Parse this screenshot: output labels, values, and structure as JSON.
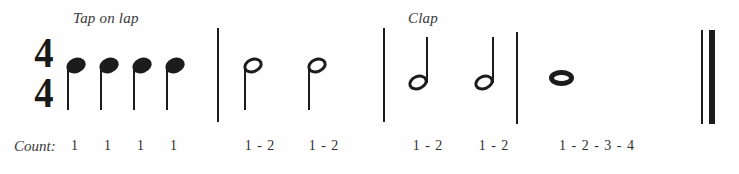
{
  "page": {
    "background_color": "#fefefe",
    "ink_color": "#1c1c1c"
  },
  "time_signature": {
    "numerator": "4",
    "denominator": "4",
    "label": "4/4"
  },
  "instructions": [
    {
      "text": "Tap on lap",
      "x": 73,
      "y": 10
    },
    {
      "text": "Clap",
      "x": 408,
      "y": 10
    }
  ],
  "count_row": {
    "label": "Count:",
    "cells": [
      {
        "text": "1",
        "x": 75
      },
      {
        "text": "1",
        "x": 108
      },
      {
        "text": "1",
        "x": 141
      },
      {
        "text": "1",
        "x": 174
      },
      {
        "text": "1 - 2",
        "x": 260
      },
      {
        "text": "1 - 2",
        "x": 324
      },
      {
        "text": "1 - 2",
        "x": 428
      },
      {
        "text": "1 - 2",
        "x": 494
      },
      {
        "text": "1 - 2 - 3 - 4",
        "x": 597
      }
    ]
  },
  "barlines": [
    {
      "name": "barline-1",
      "x": 217,
      "y": 28,
      "height": 94,
      "kind": "single"
    },
    {
      "name": "barline-2",
      "x": 383,
      "y": 28,
      "height": 94,
      "kind": "single"
    },
    {
      "name": "barline-3",
      "x": 516,
      "y": 32,
      "height": 92,
      "kind": "single"
    },
    {
      "name": "final-barline-thin",
      "x": 701,
      "y": 30,
      "height": 94,
      "kind": "final-thin"
    },
    {
      "name": "final-barline-thick",
      "x": 709,
      "y": 30,
      "height": 94,
      "kind": "final-thick"
    }
  ],
  "notes": [
    {
      "name": "quarter-note-1",
      "type": "quarter",
      "head": "filled",
      "stem": "down",
      "x": 66,
      "y": 58,
      "duration_beats": 1
    },
    {
      "name": "quarter-note-2",
      "type": "quarter",
      "head": "filled",
      "stem": "down",
      "x": 99,
      "y": 58,
      "duration_beats": 1
    },
    {
      "name": "quarter-note-3",
      "type": "quarter",
      "head": "filled",
      "stem": "down",
      "x": 132,
      "y": 58,
      "duration_beats": 1
    },
    {
      "name": "quarter-note-4",
      "type": "quarter",
      "head": "filled",
      "stem": "down",
      "x": 165,
      "y": 58,
      "duration_beats": 1
    },
    {
      "name": "half-note-1",
      "type": "half",
      "head": "hollow",
      "stem": "down",
      "x": 243,
      "y": 58,
      "duration_beats": 2
    },
    {
      "name": "half-note-2",
      "type": "half",
      "head": "hollow",
      "stem": "down",
      "x": 307,
      "y": 58,
      "duration_beats": 2
    },
    {
      "name": "half-note-3",
      "type": "half",
      "head": "hollow",
      "stem": "up",
      "x": 408,
      "y": 75,
      "duration_beats": 2
    },
    {
      "name": "half-note-4",
      "type": "half",
      "head": "hollow",
      "stem": "up",
      "x": 474,
      "y": 75,
      "duration_beats": 2
    },
    {
      "name": "whole-note-1",
      "type": "whole",
      "head": "whole",
      "stem": "none",
      "x": 549,
      "y": 70,
      "duration_beats": 4
    }
  ],
  "measures": [
    {
      "index": 1,
      "instruction": "Tap on lap",
      "contents": "four quarter notes",
      "counts": [
        "1",
        "1",
        "1",
        "1"
      ]
    },
    {
      "index": 2,
      "instruction": "Tap on lap",
      "contents": "two half notes",
      "counts": [
        "1 - 2",
        "1 - 2"
      ]
    },
    {
      "index": 3,
      "instruction": "Clap",
      "contents": "two half notes",
      "counts": [
        "1 - 2",
        "1 - 2"
      ]
    },
    {
      "index": 4,
      "instruction": "Clap",
      "contents": "one whole note",
      "counts": [
        "1 - 2 - 3 - 4"
      ]
    }
  ]
}
